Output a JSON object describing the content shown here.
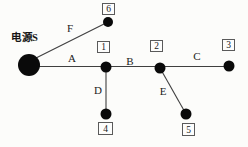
{
  "diagram": {
    "source": {
      "label": "电源S"
    },
    "nodes": [
      {
        "id": "1",
        "label": "1"
      },
      {
        "id": "2",
        "label": "2"
      },
      {
        "id": "3",
        "label": "3"
      },
      {
        "id": "4",
        "label": "4"
      },
      {
        "id": "5",
        "label": "5"
      },
      {
        "id": "6",
        "label": "6"
      }
    ],
    "edges": [
      {
        "label": "A",
        "from": "电源S",
        "to": "1"
      },
      {
        "label": "B",
        "from": "1",
        "to": "2"
      },
      {
        "label": "C",
        "from": "2",
        "to": "3"
      },
      {
        "label": "D",
        "from": "1",
        "to": "4"
      },
      {
        "label": "E",
        "from": "2",
        "to": "5"
      },
      {
        "label": "F",
        "from": "电源S",
        "to": "6"
      }
    ],
    "colors": {
      "ink": "#1a1a1a",
      "line": "#3f3f3f",
      "dot": "#0a0a0a",
      "box_border": "#5a5a5a",
      "background": "#fcfcfa"
    }
  }
}
